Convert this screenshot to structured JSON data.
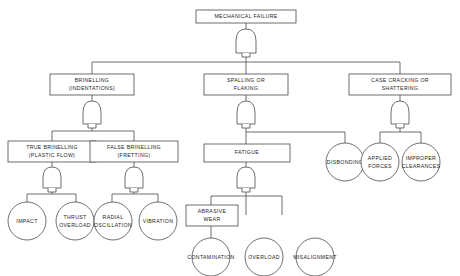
{
  "diagram": {
    "type": "fault-tree",
    "gate_type": "OR",
    "colors": {
      "stroke": "#4a4a4a",
      "text": "#1c1c1c",
      "background": "#ffffff"
    }
  },
  "nodes": {
    "mechanical_failure": {
      "label": "MECHANICAL FAILURE",
      "shape": "box"
    },
    "brinelling": {
      "label": "BRINELLING\n(INDENTATIONS)",
      "line1": "BRINELLING",
      "line2": "(INDENTATIONS)",
      "shape": "box"
    },
    "spalling": {
      "label": "SPALLING OR\nFLAKING",
      "line1": "SPALLING OR",
      "line2": "FLAKING",
      "shape": "box"
    },
    "case_cracking": {
      "label": "CASE CRACKING OR\nSHATTERING",
      "line1": "CASE CRACKING OR",
      "line2": "SHATTERING",
      "shape": "box"
    },
    "true_brinelling": {
      "label": "TRUE BRINELLING\n(PLASTIC FLOW)",
      "line1": "TRUE BRINELLING",
      "line2": "(PLASTIC FLOW)",
      "shape": "box"
    },
    "false_brinelling": {
      "label": "FALSE BRINELLING\n(FRETTING)",
      "line1": "FALSE BRINELLING",
      "line2": "(FRETTING)",
      "shape": "box"
    },
    "fatigue": {
      "label": "FATIGUE",
      "shape": "box"
    },
    "abrasive_wear": {
      "label": "ABRASIVE\nWEAR",
      "line1": "ABRASIVE",
      "line2": "WEAR",
      "shape": "box"
    },
    "impact": {
      "label": "IMPACT",
      "shape": "circle"
    },
    "thrust_overload": {
      "label": "THRUST\nOVERLOAD",
      "line1": "THRUST",
      "line2": "OVERLOAD",
      "shape": "circle"
    },
    "radial_oscillation": {
      "label": "RADIAL\nOSCILLATION",
      "line1": "RADIAL",
      "line2": "OSCILLATION",
      "shape": "circle"
    },
    "vibration": {
      "label": "VIBRATION",
      "shape": "circle"
    },
    "disbonding": {
      "label": "DISBONDING",
      "shape": "circle"
    },
    "applied_forces": {
      "label": "APPLIED\nFORCES",
      "line1": "APPLIED",
      "line2": "FORCES",
      "shape": "circle"
    },
    "improper_clearances": {
      "label": "IMPROPER\nCLEARANCES",
      "line1": "IMPROPER",
      "line2": "CLEARANCES",
      "shape": "circle"
    },
    "contamination": {
      "label": "CONTAMINATION",
      "shape": "circle"
    },
    "overload": {
      "label": "OVERLOAD",
      "shape": "circle"
    },
    "misalignment": {
      "label": "MISALIGNMENT",
      "shape": "circle"
    }
  },
  "edges": [
    {
      "from": "mechanical_failure",
      "to": "brinelling",
      "via": "OR"
    },
    {
      "from": "mechanical_failure",
      "to": "spalling",
      "via": "OR"
    },
    {
      "from": "mechanical_failure",
      "to": "case_cracking",
      "via": "OR"
    },
    {
      "from": "brinelling",
      "to": "true_brinelling",
      "via": "OR"
    },
    {
      "from": "brinelling",
      "to": "false_brinelling",
      "via": "OR"
    },
    {
      "from": "spalling",
      "to": "fatigue",
      "via": "OR"
    },
    {
      "from": "spalling",
      "to": "disbonding",
      "via": "OR"
    },
    {
      "from": "case_cracking",
      "to": "applied_forces",
      "via": "OR"
    },
    {
      "from": "case_cracking",
      "to": "improper_clearances",
      "via": "OR"
    },
    {
      "from": "true_brinelling",
      "to": "impact",
      "via": "OR"
    },
    {
      "from": "true_brinelling",
      "to": "thrust_overload",
      "via": "OR"
    },
    {
      "from": "false_brinelling",
      "to": "radial_oscillation",
      "via": "OR"
    },
    {
      "from": "false_brinelling",
      "to": "vibration",
      "via": "OR"
    },
    {
      "from": "fatigue",
      "to": "abrasive_wear",
      "via": "OR"
    },
    {
      "from": "fatigue",
      "to": "overload",
      "via": "OR"
    },
    {
      "from": "fatigue",
      "to": "misalignment",
      "via": "OR"
    },
    {
      "from": "abrasive_wear",
      "to": "contamination",
      "via": "direct"
    }
  ]
}
